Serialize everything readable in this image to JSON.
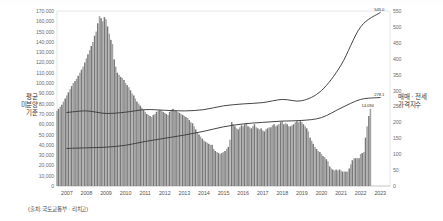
{
  "axes": {
    "left_title": "평균\n미분양\n기준",
    "right_title": "매매 · 전세\n가격지수",
    "left_ticks": [
      "170,000",
      "160,000",
      "150,000",
      "140,000",
      "130,000",
      "120,000",
      "110,000",
      "100,000",
      "90,000",
      "80,000",
      "70,000",
      "60,000",
      "50,000",
      "40,000",
      "30,000",
      "20,000",
      "10,000",
      "0"
    ],
    "right_ticks": [
      "550",
      "500",
      "450",
      "400",
      "350",
      "300",
      "250",
      "200",
      "150",
      "100",
      "50",
      "0"
    ]
  },
  "source": {
    "caption": "(출처: 국토교통부 · 리치고)"
  },
  "annotations": {
    "line_sale_end": "545.0",
    "line_jeonse_end": "278.1",
    "bar_end": "14,094"
  },
  "colors": {
    "bar": "#9a9a9a",
    "bar_dark": "#6d6d6d",
    "line_sale": "#3c3c3c",
    "line_jeonse": "#3c3c3c",
    "axis_text": "#6e6e6e",
    "frame": "#d8d8d8",
    "background": "#ffffff"
  },
  "chart_data": {
    "type": "bar",
    "title": "",
    "subtitle": "",
    "xlabel": "",
    "ylabel": "평균 미분양 기준",
    "y2label": "매매 · 전세 가격지수",
    "ylim": [
      0,
      170000
    ],
    "y2lim": [
      0,
      550
    ],
    "grid": false,
    "legend_position": "none",
    "x_tick_labels": [
      "2007",
      "2008",
      "2009",
      "2010",
      "2011",
      "2012",
      "2013",
      "2014",
      "2015",
      "2016",
      "2017",
      "2018",
      "2019",
      "2020",
      "2021",
      "2022",
      "2023"
    ],
    "x_range": [
      2007,
      2023
    ],
    "bars": {
      "name": "미분양 주택 수 (호)",
      "unit": "호",
      "x": [
        2007.0,
        2007.08,
        2007.17,
        2007.25,
        2007.33,
        2007.42,
        2007.5,
        2007.58,
        2007.67,
        2007.75,
        2007.83,
        2007.92,
        2008.0,
        2008.08,
        2008.17,
        2008.25,
        2008.33,
        2008.42,
        2008.5,
        2008.58,
        2008.67,
        2008.75,
        2008.83,
        2008.92,
        2009.0,
        2009.08,
        2009.17,
        2009.25,
        2009.33,
        2009.42,
        2009.5,
        2009.58,
        2009.67,
        2009.75,
        2009.83,
        2009.92,
        2010.0,
        2010.08,
        2010.17,
        2010.25,
        2010.33,
        2010.42,
        2010.5,
        2010.58,
        2010.67,
        2010.75,
        2010.83,
        2010.92,
        2011.0,
        2011.08,
        2011.17,
        2011.25,
        2011.33,
        2011.42,
        2011.5,
        2011.58,
        2011.67,
        2011.75,
        2011.83,
        2011.92,
        2012.0,
        2012.08,
        2012.17,
        2012.25,
        2012.33,
        2012.42,
        2012.5,
        2012.58,
        2012.67,
        2012.75,
        2012.83,
        2012.92,
        2013.0,
        2013.08,
        2013.17,
        2013.25,
        2013.33,
        2013.42,
        2013.5,
        2013.58,
        2013.67,
        2013.75,
        2013.83,
        2013.92,
        2014.0,
        2014.08,
        2014.17,
        2014.25,
        2014.33,
        2014.42,
        2014.5,
        2014.58,
        2014.67,
        2014.75,
        2014.83,
        2014.92,
        2015.0,
        2015.08,
        2015.17,
        2015.25,
        2015.33,
        2015.42,
        2015.5,
        2015.58,
        2015.67,
        2015.75,
        2015.83,
        2015.92,
        2016.0,
        2016.08,
        2016.17,
        2016.25,
        2016.33,
        2016.42,
        2016.5,
        2016.58,
        2016.67,
        2016.75,
        2016.83,
        2016.92,
        2017.0,
        2017.08,
        2017.17,
        2017.25,
        2017.33,
        2017.42,
        2017.5,
        2017.58,
        2017.67,
        2017.75,
        2017.83,
        2017.92,
        2018.0,
        2018.08,
        2018.17,
        2018.25,
        2018.33,
        2018.42,
        2018.5,
        2018.58,
        2018.67,
        2018.75,
        2018.83,
        2018.92,
        2019.0,
        2019.08,
        2019.17,
        2019.25,
        2019.33,
        2019.42,
        2019.5,
        2019.58,
        2019.67,
        2019.75,
        2019.83,
        2019.92,
        2020.0,
        2020.08,
        2020.17,
        2020.25,
        2020.33,
        2020.42,
        2020.5,
        2020.58,
        2020.67,
        2020.75,
        2020.83,
        2020.92,
        2021.0,
        2021.08,
        2021.17,
        2021.25,
        2021.33,
        2021.42,
        2021.5,
        2021.58,
        2021.67,
        2021.75,
        2021.83,
        2021.92,
        2022.0,
        2022.08,
        2022.17,
        2022.25,
        2022.33,
        2022.42,
        2022.5,
        2022.58,
        2022.67,
        2022.75,
        2022.83,
        2022.92,
        2023.0
      ],
      "values": [
        73000,
        75000,
        77000,
        79000,
        82000,
        85000,
        88000,
        91000,
        94000,
        97000,
        100000,
        102000,
        104000,
        107000,
        110000,
        113000,
        116000,
        120000,
        124000,
        128000,
        132000,
        136000,
        140000,
        146000,
        150000,
        158000,
        165000,
        163000,
        160000,
        164000,
        162000,
        155000,
        148000,
        142000,
        138000,
        123000,
        116000,
        110000,
        108000,
        106000,
        105000,
        103000,
        100000,
        98000,
        96000,
        93000,
        90000,
        88000,
        85000,
        82000,
        80000,
        78000,
        76000,
        74000,
        72000,
        70000,
        69000,
        68000,
        67000,
        69000,
        70000,
        72000,
        73000,
        74000,
        73000,
        72000,
        71000,
        70000,
        69000,
        72000,
        74000,
        75000,
        74000,
        73000,
        72000,
        71000,
        70000,
        69000,
        68000,
        67000,
        66000,
        64000,
        62000,
        61000,
        58000,
        55000,
        52000,
        50000,
        48000,
        46000,
        44000,
        43000,
        42000,
        41000,
        40000,
        40000,
        36000,
        34000,
        33000,
        32000,
        31000,
        32000,
        33000,
        34000,
        36000,
        38000,
        45000,
        62000,
        60000,
        58000,
        56000,
        55000,
        57000,
        59000,
        58000,
        60000,
        61000,
        58000,
        57000,
        56000,
        58000,
        60000,
        57000,
        56000,
        55000,
        56000,
        54000,
        53000,
        55000,
        56000,
        57000,
        57000,
        59000,
        60000,
        58000,
        59000,
        60000,
        62000,
        63000,
        60000,
        61000,
        60000,
        58000,
        58000,
        59000,
        60000,
        62000,
        63000,
        62000,
        63000,
        62000,
        60000,
        58000,
        56000,
        53000,
        47000,
        44000,
        41000,
        38000,
        36000,
        34000,
        33000,
        31000,
        29000,
        28000,
        26000,
        24000,
        19000,
        17000,
        16000,
        15000,
        16000,
        15000,
        16000,
        15000,
        14000,
        14000,
        14000,
        14000,
        17000,
        21000,
        25000,
        27000,
        27000,
        27000,
        27000,
        31000,
        32000,
        33000,
        47000,
        58000,
        68000,
        75000
      ]
    },
    "series": [
      {
        "name": "매매가격지수",
        "axis": "right",
        "end_label": "545.0",
        "x": [
          2007,
          2008,
          2009,
          2010,
          2011,
          2012,
          2013,
          2014,
          2015,
          2016,
          2017,
          2018,
          2019,
          2020,
          2021,
          2022,
          2023
        ],
        "values": [
          231,
          236,
          228,
          232,
          240,
          238,
          236,
          240,
          252,
          258,
          262,
          272,
          268,
          300,
          380,
          500,
          545
        ]
      },
      {
        "name": "전세가격지수",
        "axis": "right",
        "end_label": "278.1",
        "x": [
          2007,
          2008,
          2009,
          2010,
          2011,
          2012,
          2013,
          2014,
          2015,
          2016,
          2017,
          2018,
          2019,
          2020,
          2021,
          2022,
          2023
        ],
        "values": [
          118,
          120,
          122,
          128,
          140,
          150,
          160,
          172,
          186,
          195,
          200,
          204,
          206,
          215,
          245,
          272,
          278
        ]
      }
    ],
    "bar_end_label": "14,094"
  }
}
